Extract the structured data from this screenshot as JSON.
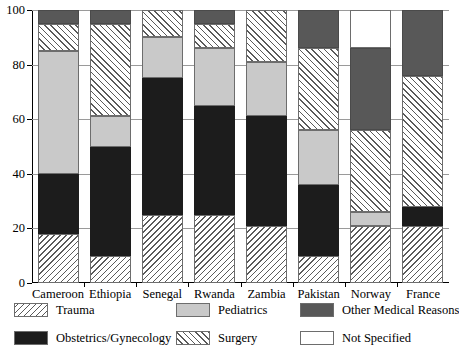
{
  "chart_data": {
    "type": "bar",
    "subtype": "stacked-bar-100",
    "title": "",
    "xlabel": "",
    "ylabel": "",
    "ylim": [
      0,
      100
    ],
    "yticks": [
      0,
      20,
      40,
      60,
      80,
      100
    ],
    "ytick_labels": [
      "0",
      "20",
      "40",
      "60",
      "80",
      "100"
    ],
    "grid": true,
    "legend_position": "bottom",
    "categories": [
      "Cameroon",
      "Ethiopia",
      "Senegal",
      "Rwanda",
      "Zambia",
      "Pakistan",
      "Norway",
      "France"
    ],
    "series": [
      {
        "name": "Trauma",
        "values": [
          18,
          10,
          25,
          25,
          21,
          10,
          21,
          21
        ]
      },
      {
        "name": "Obstetrics/Gynecology",
        "values": [
          22,
          40,
          50,
          40,
          40,
          26,
          0,
          7
        ]
      },
      {
        "name": "Pediatrics",
        "values": [
          45,
          11,
          15,
          21,
          20,
          20,
          5,
          0
        ]
      },
      {
        "name": "Surgery",
        "values": [
          10,
          34,
          10,
          9,
          19,
          30,
          30,
          48
        ]
      },
      {
        "name": "Other Medical Reasons",
        "values": [
          5,
          5,
          0,
          5,
          0,
          14,
          30,
          24
        ]
      },
      {
        "name": "Not Specified",
        "values": [
          0,
          0,
          0,
          0,
          0,
          0,
          14,
          0
        ]
      }
    ],
    "cumulative_boundaries": {
      "Cameroon": [
        0,
        18,
        40,
        85,
        95,
        100,
        100
      ],
      "Ethiopia": [
        0,
        10,
        50,
        61,
        95,
        100,
        100
      ],
      "Senegal": [
        0,
        25,
        75,
        90,
        100,
        100,
        100
      ],
      "Rwanda": [
        0,
        25,
        65,
        86,
        95,
        100,
        100
      ],
      "Zambia": [
        0,
        21,
        61,
        81,
        100,
        100,
        100
      ],
      "Pakistan": [
        0,
        10,
        36,
        56,
        86,
        100,
        100
      ],
      "Norway": [
        0,
        21,
        21,
        26,
        56,
        86,
        100
      ],
      "France": [
        0,
        21,
        28,
        28,
        76,
        100,
        100
      ]
    }
  },
  "legend": {
    "items": [
      {
        "label": "Trauma",
        "pattern": "backslash-hatch",
        "color": "#ffffff"
      },
      {
        "label": "Pediatrics",
        "pattern": "solid",
        "color": "#c9c9c9"
      },
      {
        "label": "Other Medical Reasons",
        "pattern": "solid",
        "color": "#585858"
      },
      {
        "label": "Obstetrics/Gynecology",
        "pattern": "solid",
        "color": "#1c1c1c"
      },
      {
        "label": "Surgery",
        "pattern": "forwardslash-hatch",
        "color": "#ffffff"
      },
      {
        "label": "Not Specified",
        "pattern": "solid",
        "color": "#ffffff"
      }
    ]
  }
}
